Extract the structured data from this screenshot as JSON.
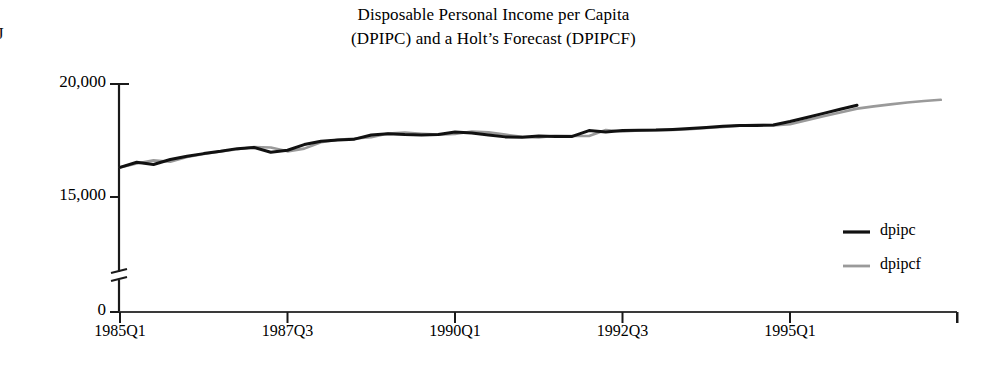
{
  "chart_data": {
    "type": "line",
    "title_line1": "Disposable Personal Income per Capita",
    "title_line2": "(DPIPC) and a Holt’s Forecast (DPIPCF)",
    "xlabel": "",
    "ylabel": "",
    "ylim": [
      0,
      20000
    ],
    "y_axis_break": true,
    "y_break_between": [
      0,
      15000
    ],
    "grid": false,
    "legend_position": "right",
    "y_ticks": [
      {
        "label": "20,000",
        "value": 20000
      },
      {
        "label": "15,000",
        "value": 15000
      },
      {
        "label": "0",
        "value": 0
      }
    ],
    "x_ticks": [
      {
        "label": "1985Q1",
        "index": 0
      },
      {
        "label": "1987Q3",
        "index": 10
      },
      {
        "label": "1990Q1",
        "index": 20
      },
      {
        "label": "1992Q3",
        "index": 30
      },
      {
        "label": "1995Q1",
        "index": 40
      },
      {
        "label": "",
        "index": 50
      }
    ],
    "x_quarters": [
      "1985Q1",
      "1985Q2",
      "1985Q3",
      "1985Q4",
      "1986Q1",
      "1986Q2",
      "1986Q3",
      "1986Q4",
      "1987Q1",
      "1987Q2",
      "1987Q3",
      "1987Q4",
      "1988Q1",
      "1988Q2",
      "1988Q3",
      "1988Q4",
      "1989Q1",
      "1989Q2",
      "1989Q3",
      "1989Q4",
      "1990Q1",
      "1990Q2",
      "1990Q3",
      "1990Q4",
      "1991Q1",
      "1991Q2",
      "1991Q3",
      "1991Q4",
      "1992Q1",
      "1992Q2",
      "1992Q3",
      "1992Q4",
      "1993Q1",
      "1993Q2",
      "1993Q3",
      "1993Q4",
      "1994Q1",
      "1994Q2",
      "1994Q3",
      "1994Q4",
      "1995Q1",
      "1995Q2",
      "1995Q3",
      "1995Q4",
      "1996Q1",
      "1996Q2",
      "1996Q3",
      "1996Q4",
      "1997Q1",
      "1997Q2"
    ],
    "series": [
      {
        "name": "dpipc",
        "color": "#111111",
        "style": "solid",
        "start_index": 0,
        "values": [
          16310,
          16540,
          16440,
          16660,
          16800,
          16920,
          17020,
          17140,
          17190,
          16980,
          17070,
          17320,
          17470,
          17520,
          17560,
          17740,
          17800,
          17760,
          17740,
          17770,
          17880,
          17830,
          17740,
          17660,
          17640,
          17700,
          17680,
          17680,
          17940,
          17880,
          17940,
          17950,
          17960,
          17990,
          18030,
          18080,
          18130,
          18160,
          18160,
          18190,
          18340,
          18520,
          18700,
          18880,
          19060
        ]
      },
      {
        "name": "dpipcf",
        "color": "#9a9a9a",
        "style": "solid",
        "start_index": 0,
        "values": [
          16310,
          16480,
          16620,
          16560,
          16770,
          16900,
          17010,
          17110,
          17210,
          17190,
          17020,
          17140,
          17420,
          17530,
          17590,
          17650,
          17810,
          17850,
          17800,
          17760,
          17790,
          17900,
          17860,
          17760,
          17660,
          17640,
          17710,
          17700,
          17700,
          17960,
          17900,
          17950,
          17960,
          17970,
          18000,
          18050,
          18100,
          18160,
          18190,
          18170,
          18220,
          18400,
          18570,
          18740,
          18910,
          19010,
          19100,
          19180,
          19250,
          19300
        ]
      }
    ],
    "legend": [
      {
        "label": "dpipc",
        "color": "#111111"
      },
      {
        "label": "dpipcf",
        "color": "#9a9a9a"
      }
    ]
  },
  "artifacts": {
    "stray_mark": "J"
  }
}
